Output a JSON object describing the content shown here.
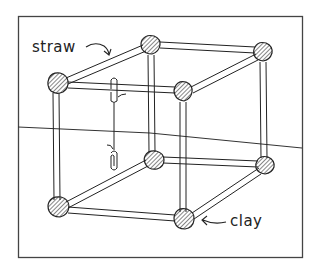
{
  "figure": {
    "colors": {
      "ink": "#222222",
      "background": "#ffffff",
      "frame": "#444444"
    },
    "labels": {
      "straw": "straw",
      "clay": "clay"
    },
    "parts": {
      "frame_border": "picture-frame",
      "wall_floor_line": "horizon-line",
      "joints_count": 8,
      "straws_count": 12,
      "pendulum": "paperclip-on-thread"
    }
  }
}
